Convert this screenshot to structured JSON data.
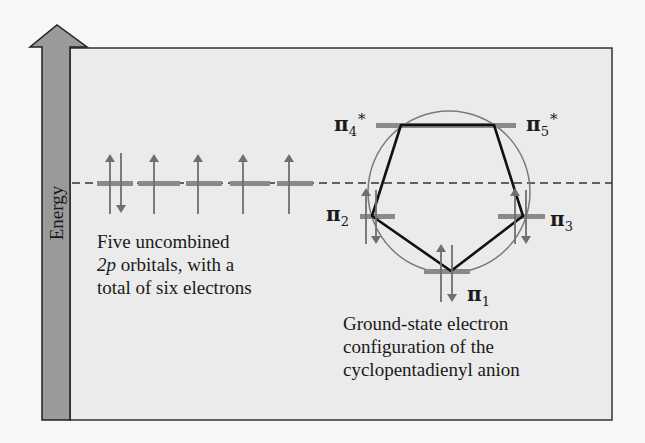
{
  "diagram": {
    "axis": {
      "label": "Energy",
      "arrow_color": "#9a9a9a",
      "arrow_stroke": "#222222"
    },
    "panel": {
      "background": "#ebebeb",
      "border": "#333333"
    },
    "reference_line": {
      "style": "dashed",
      "meaning": "energy of an isolated 2p orbital"
    },
    "left_group": {
      "caption_line1": "Five uncombined",
      "caption_line2_italic": "2p",
      "caption_line2_rest": " orbitals, with a",
      "caption_line3": "total of six electrons",
      "orbitals": [
        {
          "electrons": "up-down"
        },
        {
          "electrons": "up"
        },
        {
          "electrons": "up"
        },
        {
          "electrons": "up"
        },
        {
          "electrons": "up"
        }
      ]
    },
    "right_group": {
      "caption_line1": "Ground-state electron",
      "caption_line2": "configuration of the",
      "caption_line3": "cyclopentadienyl anion",
      "orbitals": [
        {
          "symbol": "π",
          "subscript": "1",
          "superscript": "",
          "electrons": "up-down",
          "level": "lowest"
        },
        {
          "symbol": "π",
          "subscript": "2",
          "superscript": "",
          "electrons": "up-down",
          "level": "bonding"
        },
        {
          "symbol": "π",
          "subscript": "3",
          "superscript": "",
          "electrons": "up-down",
          "level": "bonding"
        },
        {
          "symbol": "π",
          "subscript": "4",
          "superscript": "*",
          "electrons": "none",
          "level": "antibonding"
        },
        {
          "symbol": "π",
          "subscript": "5",
          "superscript": "*",
          "electrons": "none",
          "level": "antibonding"
        }
      ]
    },
    "colors": {
      "orbital_bar": "#8a8a8a",
      "electron_arrow": "#6f6f6f",
      "pentagon": "#111111",
      "circle": "#7a7a7a",
      "text": "#1a1a1a"
    }
  }
}
